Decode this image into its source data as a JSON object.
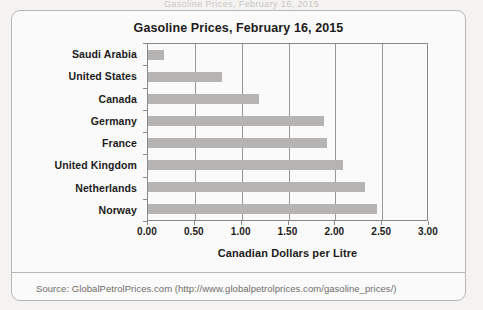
{
  "scan_artifact_text": "Gasoline Prices, February 16, 2015",
  "card": {
    "source_note": "Source: GlobalPetrolPrices.com (http://www.globalpetrolprices.com/gasoline_prices/)"
  },
  "chart_data": {
    "type": "bar",
    "orientation": "horizontal",
    "title": "Gasoline Prices, February 16, 2015",
    "xlabel": "Canadian Dollars per Litre",
    "ylabel": "",
    "categories": [
      "Saudi Arabia",
      "United States",
      "Canada",
      "Germany",
      "France",
      "United Kingdom",
      "Netherlands",
      "Norway"
    ],
    "values": [
      0.17,
      0.79,
      1.19,
      1.88,
      1.91,
      2.08,
      2.32,
      2.45
    ],
    "xlim": [
      0.0,
      3.0
    ],
    "xticks": [
      0.0,
      0.5,
      1.0,
      1.5,
      2.0,
      2.5,
      3.0
    ],
    "xtick_labels": [
      "0.00",
      "0.50",
      "1.00",
      "1.50",
      "2.00",
      "2.50",
      "3.00"
    ],
    "grid": "vertical",
    "legend": "none",
    "bar_color": "#b5b4b2",
    "axis_color": "#8c8a88"
  }
}
